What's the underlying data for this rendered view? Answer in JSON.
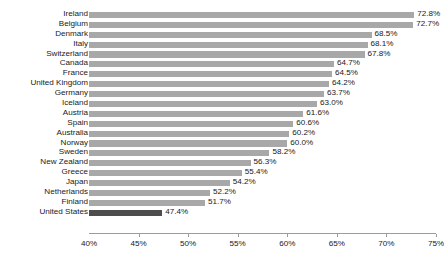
{
  "chart_data": {
    "type": "bar",
    "orientation": "horizontal",
    "title": "",
    "subtitle": "",
    "xlabel": "",
    "ylabel": "",
    "xlim": [
      40,
      75
    ],
    "xticks": [
      40,
      45,
      50,
      55,
      60,
      65,
      70,
      75
    ],
    "xtick_labels": [
      "40%",
      "45%",
      "50%",
      "55%",
      "60%",
      "65%",
      "70%",
      "75%"
    ],
    "grid": false,
    "legend": "none",
    "value_suffix": "%",
    "bar_color": "#a8a8a8",
    "highlight_color": "#4d4d4d",
    "highlight_category": "United States",
    "categories": [
      "Ireland",
      "Belgium",
      "Denmark",
      "Italy",
      "Switzerland",
      "Canada",
      "France",
      "United Kingdom",
      "Germany",
      "Iceland",
      "Austria",
      "Spain",
      "Australia",
      "Norway",
      "Sweden",
      "New Zealand",
      "Greece",
      "Japan",
      "Netherlands",
      "Finland",
      "United States"
    ],
    "values": [
      72.8,
      72.7,
      68.5,
      68.1,
      67.8,
      64.7,
      64.5,
      64.2,
      63.7,
      63.0,
      61.6,
      60.6,
      60.2,
      60.0,
      58.2,
      56.3,
      55.4,
      54.2,
      52.2,
      51.7,
      47.4
    ],
    "value_labels": [
      "72.8%",
      "72.7%",
      "68.5%",
      "68.1%",
      "67.8%",
      "64.7%",
      "64.5%",
      "64.2%",
      "63.7%",
      "63.0%",
      "61.6%",
      "60.6%",
      "60.2%",
      "60.0%",
      "58.2%",
      "56.3%",
      "55.4%",
      "54.2%",
      "52.2%",
      "51.7%",
      "47.4%"
    ]
  }
}
